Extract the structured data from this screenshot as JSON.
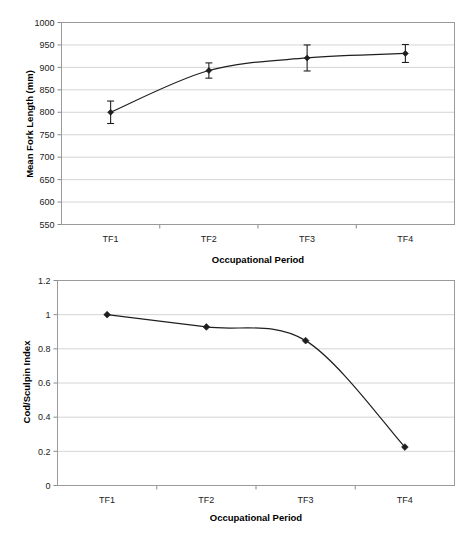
{
  "figure": {
    "background": "#ffffff",
    "line_color": "#1f1f1f",
    "grid_color": "#c9c9c9",
    "axis_color": "#8a8a8a"
  },
  "charts": [
    {
      "id": "mean-fork-length",
      "ylabel": "Mean Fork Length (mm)",
      "xlabel": "Occupational Period"
    },
    {
      "id": "cod-sculpin-index",
      "ylabel": "Cod/Sculpin Index",
      "xlabel": "Occupational Period"
    }
  ],
  "chart_data": [
    {
      "type": "line",
      "title": "",
      "xlabel": "Occupational Period",
      "ylabel": "Mean Fork Length (mm)",
      "categories": [
        "TF1",
        "TF2",
        "TF3",
        "TF4"
      ],
      "values": [
        800,
        893,
        921,
        931
      ],
      "error_low": [
        775,
        876,
        892,
        911
      ],
      "error_high": [
        825,
        910,
        950,
        951
      ],
      "error_bars": [
        25,
        17,
        29,
        20
      ],
      "ylim": [
        550,
        1000
      ],
      "yticks": [
        550,
        600,
        650,
        700,
        750,
        800,
        850,
        900,
        950,
        1000
      ],
      "ytick_labels": [
        "550",
        "600",
        "650",
        "700",
        "750",
        "800",
        "850",
        "900",
        "950",
        "1000"
      ],
      "grid": "horizontal",
      "legend": "none",
      "smoothed": true,
      "marker": "diamond"
    },
    {
      "type": "line",
      "title": "",
      "xlabel": "Occupational Period",
      "ylabel": "Cod/Sculpin Index",
      "categories": [
        "TF1",
        "TF2",
        "TF3",
        "TF4"
      ],
      "values": [
        1.0,
        0.928,
        0.848,
        0.225
      ],
      "ylim": [
        0,
        1.2
      ],
      "yticks": [
        0,
        0.2,
        0.4,
        0.6,
        0.8,
        1,
        1.2
      ],
      "ytick_labels": [
        "0",
        "0.2",
        "0.4",
        "0.6",
        "0.8",
        "1",
        "1.2"
      ],
      "grid": "horizontal",
      "legend": "none",
      "smoothed": true,
      "marker": "diamond"
    }
  ]
}
